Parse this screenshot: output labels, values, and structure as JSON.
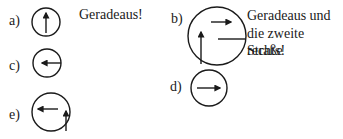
{
  "items": [
    {
      "label": "a)",
      "caption": "Geradeaus!",
      "sign": "straight-arrow"
    },
    {
      "label": "b)",
      "caption_lines": [
        "Geradeaus und",
        "die zweite Straße",
        "rechts!"
      ],
      "sign": "straight-then-second-right"
    },
    {
      "label": "c)",
      "sign": "left-arrow-from-right-edge"
    },
    {
      "label": "d)",
      "sign": "right-arrow"
    },
    {
      "label": "e)",
      "sign": "straight-then-left"
    }
  ]
}
